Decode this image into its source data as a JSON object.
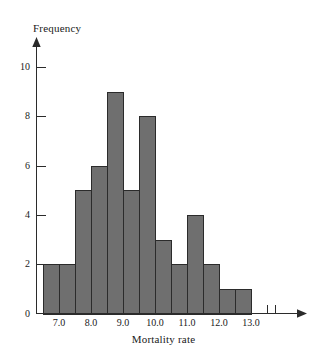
{
  "chart_data": {
    "type": "bar",
    "title": "",
    "xlabel": "Mortality rate",
    "ylabel": "Frequency",
    "bin_width": 0.5,
    "bin_edges": [
      6.5,
      7.0,
      7.5,
      8.0,
      8.5,
      9.0,
      9.5,
      10.0,
      10.5,
      11.0,
      11.5,
      12.0,
      12.5,
      13.0
    ],
    "categories": [
      "6.5-7.0",
      "7.0-7.5",
      "7.5-8.0",
      "8.0-8.5",
      "8.5-9.0",
      "9.0-9.5",
      "9.5-10.0",
      "10.0-10.5",
      "10.5-11.0",
      "11.0-11.5",
      "11.5-12.0",
      "12.0-12.5",
      "12.5-13.0"
    ],
    "values": [
      2,
      2,
      5,
      6,
      9,
      5,
      8,
      3,
      2,
      4,
      2,
      1,
      1
    ],
    "xlim": [
      6.3,
      13.9
    ],
    "ylim": [
      0,
      10.6
    ],
    "xticks": [
      7.0,
      8.0,
      9.0,
      10.0,
      11.0,
      12.0,
      13.0
    ],
    "xtick_labels": [
      "7.0",
      "8.0",
      "9.0",
      "10.0",
      "11.0",
      "12.0",
      "13.0"
    ],
    "yticks": [
      0,
      2,
      4,
      6,
      8,
      10
    ],
    "ytick_labels": [
      "0",
      "2",
      "4",
      "6",
      "8",
      "10"
    ],
    "grid": false,
    "legend": null,
    "bar_color": "#6f6f6f",
    "bar_edge_color": "#2b2b2b",
    "axis_color": "#2b2b2b"
  },
  "axes": {
    "y_title": "Frequency",
    "x_title": "Mortality rate"
  }
}
